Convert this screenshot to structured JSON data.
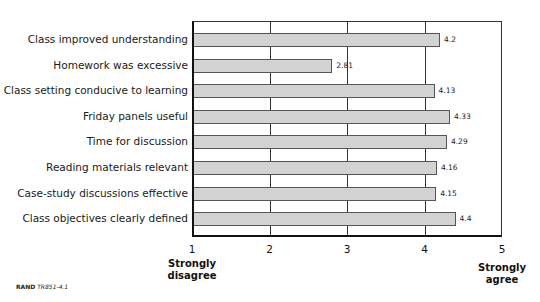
{
  "chart_data": {
    "type": "bar",
    "orientation": "horizontal",
    "categories": [
      "Class improved understanding",
      "Homework was excessive",
      "Class setting conducive to learning",
      "Friday panels useful",
      "Time for discussion",
      "Reading materials relevant",
      "Case-study discussions effective",
      "Class objectives clearly defined"
    ],
    "values": [
      4.2,
      2.81,
      4.13,
      4.33,
      4.29,
      4.16,
      4.15,
      4.4
    ],
    "value_labels": [
      "4.2",
      "2.81",
      "4.13",
      "4.33",
      "4.29",
      "4.16",
      "4.15",
      "4.4"
    ],
    "title": "",
    "xlabel": "",
    "ylabel": "",
    "xlim": [
      1,
      5
    ],
    "xticks": [
      "1",
      "2",
      "3",
      "4",
      "5"
    ],
    "scale_anchors": {
      "low": "Strongly disagree",
      "high": "Strongly agree"
    },
    "grid": true,
    "legend": null,
    "colors": {
      "bar_fill": "#d3d3d3",
      "bar_border": "#555555",
      "axis": "#111111"
    }
  },
  "source": {
    "org": "RAND",
    "id": "TR851-4.1"
  },
  "labels": {
    "low_line1": "Strongly",
    "low_line2": "disagree",
    "high_line1": "Strongly",
    "high_line2": "agree"
  }
}
